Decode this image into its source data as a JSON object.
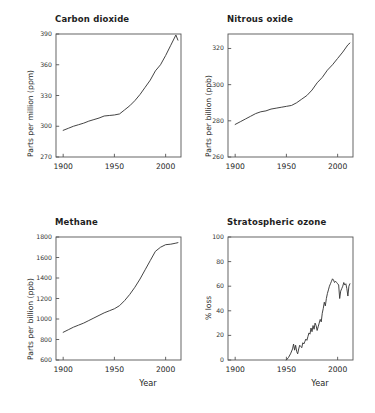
{
  "figure": {
    "background": "#ffffff",
    "line_color": "#3a3a3a",
    "frame_color": "#555555"
  },
  "chart_data": [
    {
      "type": "line",
      "title": "Carbon dioxide",
      "xlabel": "",
      "ylabel": "Parts per million (ppm)",
      "xlim": [
        1893,
        2015
      ],
      "ylim": [
        270,
        390
      ],
      "xticks": [
        1900,
        1950,
        2000
      ],
      "yticks": [
        270,
        300,
        330,
        360,
        390
      ],
      "xtick_labels": [
        "1900",
        "1950",
        "2000"
      ],
      "ytick_labels": [
        "270",
        "300",
        "330",
        "360",
        "390"
      ],
      "grid": false,
      "legend": "none",
      "x": [
        1900,
        1905,
        1910,
        1915,
        1920,
        1925,
        1930,
        1935,
        1940,
        1945,
        1950,
        1955,
        1960,
        1965,
        1970,
        1975,
        1980,
        1985,
        1990,
        1995,
        2000,
        2005,
        2010,
        2012
      ],
      "values": [
        296,
        298,
        300,
        301.5,
        303,
        305,
        306.5,
        308,
        310,
        310.5,
        311,
        312,
        316,
        320,
        325,
        331,
        338,
        345,
        354,
        360,
        369,
        379,
        389,
        384
      ]
    },
    {
      "type": "line",
      "title": "Nitrous oxide",
      "xlabel": "",
      "ylabel": "Parts per billion (ppb)",
      "xlim": [
        1893,
        2015
      ],
      "ylim": [
        260,
        328
      ],
      "xticks": [
        1900,
        1950,
        2000
      ],
      "yticks": [
        260,
        280,
        300,
        320
      ],
      "xtick_labels": [
        "1900",
        "1950",
        "2000"
      ],
      "ytick_labels": [
        "260",
        "280",
        "300",
        "320"
      ],
      "grid": false,
      "legend": "none",
      "x": [
        1900,
        1905,
        1910,
        1915,
        1920,
        1925,
        1930,
        1935,
        1940,
        1945,
        1950,
        1955,
        1960,
        1965,
        1970,
        1975,
        1980,
        1985,
        1990,
        1995,
        2000,
        2005,
        2010,
        2012
      ],
      "values": [
        278,
        279.5,
        281,
        282.5,
        284,
        285,
        285.5,
        286.5,
        287,
        287.5,
        288,
        288.5,
        290,
        292,
        294,
        297,
        301,
        304,
        308,
        311,
        314.5,
        318,
        322,
        323
      ]
    },
    {
      "type": "line",
      "title": "Methane",
      "xlabel": "Year",
      "ylabel": "Parts per billion (ppb)",
      "xlim": [
        1893,
        2015
      ],
      "ylim": [
        600,
        1800
      ],
      "xticks": [
        1900,
        1950,
        2000
      ],
      "yticks": [
        600,
        800,
        1000,
        1200,
        1400,
        1600,
        1800
      ],
      "xtick_labels": [
        "1900",
        "1950",
        "2000"
      ],
      "ytick_labels": [
        "600",
        "800",
        "1000",
        "1200",
        "1400",
        "1600",
        "1800"
      ],
      "grid": false,
      "legend": "none",
      "x": [
        1900,
        1905,
        1910,
        1915,
        1920,
        1925,
        1930,
        1935,
        1940,
        1945,
        1950,
        1955,
        1960,
        1965,
        1970,
        1975,
        1980,
        1985,
        1990,
        1995,
        2000,
        2005,
        2010,
        2012
      ],
      "values": [
        870,
        895,
        920,
        940,
        960,
        985,
        1010,
        1035,
        1060,
        1080,
        1100,
        1130,
        1180,
        1240,
        1310,
        1390,
        1480,
        1570,
        1660,
        1700,
        1725,
        1730,
        1740,
        1745
      ]
    },
    {
      "type": "line",
      "title": "Stratospheric ozone",
      "xlabel": "Year",
      "ylabel": "% loss",
      "xlim": [
        1893,
        2015
      ],
      "ylim": [
        0,
        100
      ],
      "xticks": [
        1900,
        1950,
        2000
      ],
      "yticks": [
        0,
        20,
        40,
        60,
        80,
        100
      ],
      "xtick_labels": [
        "1900",
        "1950",
        "2000"
      ],
      "ytick_labels": [
        "0",
        "20",
        "40",
        "60",
        "80",
        "100"
      ],
      "grid": false,
      "legend": "none",
      "x": [
        1950,
        1952,
        1954,
        1956,
        1957,
        1958,
        1959,
        1960,
        1961,
        1962,
        1963,
        1964,
        1965,
        1966,
        1967,
        1968,
        1969,
        1970,
        1971,
        1972,
        1973,
        1974,
        1975,
        1976,
        1977,
        1978,
        1979,
        1980,
        1981,
        1982,
        1983,
        1984,
        1985,
        1986,
        1987,
        1988,
        1989,
        1990,
        1991,
        1992,
        1993,
        1994,
        1995,
        1996,
        1997,
        1998,
        1999,
        2000,
        2001,
        2002,
        2003,
        2004,
        2005,
        2006,
        2007,
        2008,
        2009,
        2010,
        2011,
        2012
      ],
      "values": [
        0,
        2,
        5,
        9,
        13,
        8,
        12,
        7,
        5,
        9,
        12,
        11,
        10,
        14,
        13,
        15,
        17,
        16,
        19,
        22,
        21,
        26,
        23,
        28,
        25,
        30,
        28,
        24,
        27,
        30,
        33,
        31,
        38,
        42,
        47,
        44,
        50,
        54,
        57,
        60,
        62,
        64,
        66,
        65,
        63,
        64,
        63,
        62,
        61,
        50,
        56,
        58,
        60,
        63,
        61,
        62,
        58,
        52,
        60,
        62
      ]
    }
  ]
}
